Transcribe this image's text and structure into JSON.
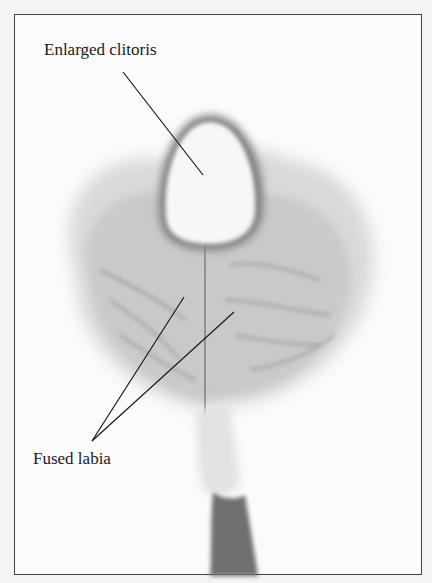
{
  "figure": {
    "type": "anatomical-illustration",
    "style": "grayscale drawing in bordered frame",
    "labels": [
      {
        "id": "enlarged-clitoris",
        "text": "Enlarged clitoris",
        "x": 44,
        "y": 36,
        "leader_lines": [
          {
            "x1": 123,
            "y1": 72,
            "x2": 203,
            "y2": 175
          }
        ]
      },
      {
        "id": "fused-labia",
        "text": "Fused labia",
        "x": 33,
        "y": 447,
        "leader_lines": [
          {
            "x1": 92,
            "y1": 441,
            "x2": 184,
            "y2": 297
          },
          {
            "x1": 92,
            "y1": 441,
            "x2": 234,
            "y2": 312
          }
        ]
      }
    ],
    "colors": {
      "border": "#444444",
      "background": "#fbfbfb",
      "ink": "#1a1a1a",
      "shading": "#9a9a9a"
    }
  }
}
